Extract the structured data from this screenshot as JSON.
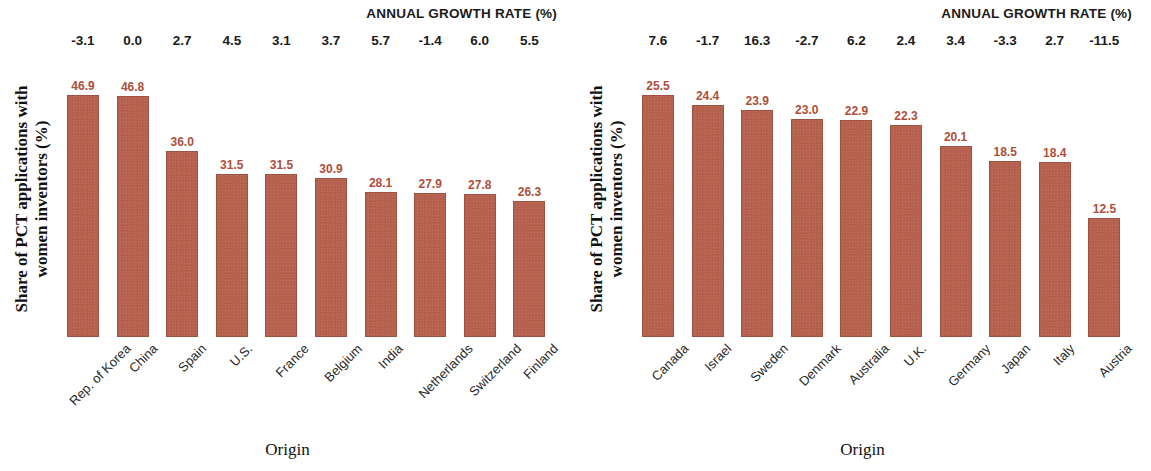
{
  "theme": {
    "bar_color": "#b5614e",
    "value_label_color": "#ad4f3b",
    "text_color": "#1b1b1b",
    "background": "#ffffff"
  },
  "panels": [
    {
      "growth_title": "ANNUAL GROWTH RATE (%)",
      "y_axis_line1": "Share of PCT applications with",
      "y_axis_line2": "women inventors (%)",
      "x_axis_title": "Origin"
    },
    {
      "growth_title": "ANNUAL GROWTH RATE (%)",
      "y_axis_line1": "Share of PCT applications with",
      "y_axis_line2": "women inventors (%)",
      "x_axis_title": "Origin"
    }
  ],
  "chart_data": [
    {
      "type": "bar",
      "title": "ANNUAL GROWTH RATE (%)",
      "xlabel": "Origin",
      "ylabel": "Share of PCT applications with women inventors (%)",
      "ylim": [
        0,
        48
      ],
      "grid": false,
      "legend": null,
      "categories": [
        "Rep. of Korea",
        "China",
        "Spain",
        "U.S.",
        "France",
        "Belgium",
        "India",
        "Netherlands",
        "Switzerland",
        "Finland"
      ],
      "values": [
        46.9,
        46.8,
        36.0,
        31.5,
        31.5,
        30.9,
        28.1,
        27.9,
        27.8,
        26.3
      ],
      "value_labels": [
        "46.9",
        "46.8",
        "36.0",
        "31.5",
        "31.5",
        "30.9",
        "28.1",
        "27.9",
        "27.8",
        "26.3"
      ],
      "annotations": {
        "name": "annual_growth_rate_percent",
        "values": [
          -3.1,
          0.0,
          2.7,
          4.5,
          3.1,
          3.7,
          5.7,
          -1.4,
          6.0,
          5.5
        ],
        "labels": [
          "-3.1",
          "0.0",
          "2.7",
          "4.5",
          "3.1",
          "3.7",
          "5.7",
          "-1.4",
          "6.0",
          "5.5"
        ]
      }
    },
    {
      "type": "bar",
      "title": "ANNUAL GROWTH RATE (%)",
      "xlabel": "Origin",
      "ylabel": "Share of PCT applications with women inventors (%)",
      "ylim": [
        0,
        26
      ],
      "grid": false,
      "legend": null,
      "categories": [
        "Canada",
        "Israel",
        "Sweden",
        "Denmark",
        "Australia",
        "U.K.",
        "Germany",
        "Japan",
        "Italy",
        "Austria"
      ],
      "values": [
        25.5,
        24.4,
        23.9,
        23.0,
        22.9,
        22.3,
        20.1,
        18.5,
        18.4,
        12.5
      ],
      "value_labels": [
        "25.5",
        "24.4",
        "23.9",
        "23.0",
        "22.9",
        "22.3",
        "20.1",
        "18.5",
        "18.4",
        "12.5"
      ],
      "annotations": {
        "name": "annual_growth_rate_percent",
        "values": [
          7.6,
          -1.7,
          16.3,
          -2.7,
          6.2,
          2.4,
          3.4,
          -3.3,
          2.7,
          -11.5
        ],
        "labels": [
          "7.6",
          "-1.7",
          "16.3",
          "-2.7",
          "6.2",
          "2.4",
          "3.4",
          "-3.3",
          "2.7",
          "-11.5"
        ]
      }
    }
  ]
}
